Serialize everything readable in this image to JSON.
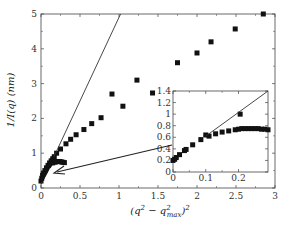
{
  "chart_data": [
    {
      "id": "main",
      "type": "scatter",
      "title": "",
      "xlabel": "(q² − q²max)²",
      "ylabel": "1/I(q) (nm)",
      "xlim": [
        0,
        3
      ],
      "ylim": [
        0,
        5
      ],
      "xticks": [
        0,
        0.5,
        1,
        1.5,
        2,
        2.5,
        3
      ],
      "xtick_labels": [
        "0",
        "0.5",
        "1",
        "1.5",
        "2",
        "2.5",
        "3"
      ],
      "yticks": [
        0,
        1,
        2,
        3,
        4,
        5
      ],
      "ytick_labels": [
        "0",
        "1",
        "2",
        "3",
        "4",
        "5"
      ],
      "grid": false,
      "legend": null,
      "series": [
        {
          "name": "data",
          "marker": "square",
          "x": [
            0.0,
            0.01,
            0.02,
            0.03,
            0.05,
            0.07,
            0.09,
            0.11,
            0.13,
            0.15,
            0.17,
            0.2,
            0.25,
            0.32,
            0.38,
            0.45,
            0.55,
            0.65,
            0.77,
            0.91,
            1.05,
            1.23,
            1.43,
            1.75,
            2.0,
            2.18,
            2.49,
            2.85
          ],
          "y": [
            0.2,
            0.28,
            0.36,
            0.42,
            0.5,
            0.58,
            0.65,
            0.72,
            0.78,
            0.84,
            0.9,
            1.0,
            1.12,
            1.27,
            1.4,
            1.53,
            1.68,
            1.85,
            2.02,
            2.7,
            2.35,
            3.1,
            2.73,
            3.6,
            3.88,
            4.2,
            4.57,
            5.0
          ]
        },
        {
          "name": "hook",
          "marker": "square",
          "x": [
            0.15,
            0.18,
            0.2,
            0.22,
            0.24,
            0.26,
            0.28,
            0.3
          ],
          "y": [
            0.72,
            0.74,
            0.76,
            0.76,
            0.76,
            0.75,
            0.74,
            0.73
          ]
        },
        {
          "name": "fit line",
          "type": "line",
          "x": [
            0,
            1.02
          ],
          "y": [
            0.1,
            5.0
          ]
        }
      ],
      "annotations": [
        {
          "type": "arrow",
          "from": "inset",
          "to": [
            0.15,
            0.45
          ]
        }
      ]
    },
    {
      "id": "inset",
      "type": "scatter",
      "xlim": [
        0,
        0.29
      ],
      "ylim": [
        0,
        1.4
      ],
      "xticks": [
        0,
        0.1,
        0.2
      ],
      "xtick_labels": [
        "0",
        "0.1",
        "0.2"
      ],
      "yticks": [
        0,
        0.2,
        0.4,
        0.6,
        0.8,
        1.0,
        1.2,
        1.4
      ],
      "ytick_labels": [
        "0",
        "0.2",
        "0.4",
        "0.6",
        "0.8",
        "1",
        "1.2",
        "1.4"
      ],
      "series": [
        {
          "name": "data",
          "marker": "square",
          "x": [
            0.0,
            0.005,
            0.01,
            0.02,
            0.035,
            0.04,
            0.06,
            0.085,
            0.1,
            0.11,
            0.13,
            0.15,
            0.17,
            0.19,
            0.2,
            0.21,
            0.22,
            0.23,
            0.24,
            0.25,
            0.26,
            0.27,
            0.28,
            0.29,
            0.205
          ],
          "y": [
            0.2,
            0.22,
            0.25,
            0.3,
            0.37,
            0.39,
            0.47,
            0.56,
            0.64,
            0.62,
            0.66,
            0.69,
            0.71,
            0.73,
            0.74,
            0.75,
            0.75,
            0.75,
            0.75,
            0.75,
            0.75,
            0.74,
            0.74,
            0.73,
            1.0
          ]
        },
        {
          "name": "fit line",
          "type": "line",
          "x": [
            0.1,
            0.29
          ],
          "y": [
            0.62,
            1.4
          ]
        }
      ]
    }
  ],
  "labels": {
    "ylabel": "1/I(q) (nm)",
    "xlabel_main": "(q",
    "xlabel_sup1": "2",
    "xlabel_minus": " − q",
    "xlabel_sup2": "2",
    "xlabel_sub": "max",
    "xlabel_close": ")",
    "xlabel_sup3": "2"
  }
}
